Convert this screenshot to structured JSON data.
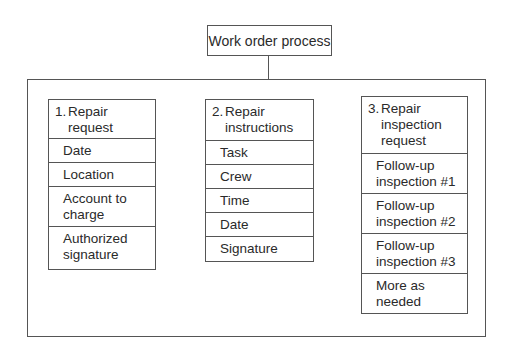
{
  "title": "Work order process",
  "columns": [
    {
      "number": "1.",
      "heading_line1": "Repair",
      "heading_line2": "request",
      "items": [
        {
          "line1": "Date",
          "line2": ""
        },
        {
          "line1": "Location",
          "line2": ""
        },
        {
          "line1": "Account to",
          "line2": "charge"
        },
        {
          "line1": "Authorized",
          "line2": "signature"
        }
      ]
    },
    {
      "number": "2.",
      "heading_line1": "Repair",
      "heading_line2": "instructions",
      "items": [
        {
          "line1": "Task",
          "line2": ""
        },
        {
          "line1": "Crew",
          "line2": ""
        },
        {
          "line1": "Time",
          "line2": ""
        },
        {
          "line1": "Date",
          "line2": ""
        },
        {
          "line1": "Signature",
          "line2": ""
        }
      ]
    },
    {
      "number": "3.",
      "heading_line1": "Repair",
      "heading_line2": "inspection",
      "heading_line3": "request",
      "items": [
        {
          "line1": "Follow-up",
          "line2": "inspection #1"
        },
        {
          "line1": "Follow-up",
          "line2": "inspection #2"
        },
        {
          "line1": "Follow-up",
          "line2": "inspection #3"
        },
        {
          "line1": "More as",
          "line2": "needed"
        }
      ]
    }
  ]
}
